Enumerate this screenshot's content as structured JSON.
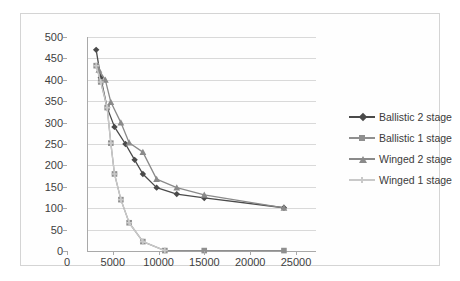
{
  "chart_data": {
    "type": "line",
    "title": "",
    "xlabel": "",
    "ylabel": "",
    "xlim": [
      0,
      25000
    ],
    "ylim": [
      0,
      500
    ],
    "xticks": [
      0,
      5000,
      10000,
      15000,
      20000,
      25000
    ],
    "yticks": [
      0,
      50,
      100,
      150,
      200,
      250,
      300,
      350,
      400,
      450,
      500
    ],
    "grid": "horizontal",
    "legend_position": "right",
    "colors": {
      "ballistic_2_stage": "#4a4a4a",
      "ballistic_1_stage": "#8f8f8f",
      "winged_2_stage": "#8a8a8a",
      "winged_1_stage": "#c9c9c9",
      "gridline": "#d9d9d9",
      "axis": "#a9a9a9",
      "border": "#d4d4d4",
      "text": "#3b3b3b"
    },
    "series": [
      {
        "name": "Ballistic 2 stage",
        "marker": "diamond",
        "color": "#4a4a4a",
        "points": [
          [
            1000,
            470
          ],
          [
            1500,
            405
          ],
          [
            2200,
            335
          ],
          [
            3000,
            290
          ],
          [
            4200,
            250
          ],
          [
            5200,
            213
          ],
          [
            6100,
            180
          ],
          [
            7600,
            148
          ],
          [
            9800,
            133
          ],
          [
            12800,
            124
          ],
          [
            21500,
            101
          ]
        ]
      },
      {
        "name": "Ballistic 1 stage",
        "marker": "square",
        "color": "#8f8f8f",
        "points": [
          [
            1000,
            433
          ],
          [
            1500,
            395
          ],
          [
            2200,
            335
          ],
          [
            2600,
            252
          ],
          [
            3000,
            180
          ],
          [
            3700,
            120
          ],
          [
            4600,
            66
          ],
          [
            6100,
            22
          ],
          [
            8500,
            1
          ],
          [
            12800,
            1
          ],
          [
            21500,
            1
          ]
        ]
      },
      {
        "name": "Winged 2 stage",
        "marker": "triangle",
        "color": "#8a8a8a",
        "points": [
          [
            1300,
            423
          ],
          [
            2000,
            400
          ],
          [
            2600,
            348
          ],
          [
            3700,
            300
          ],
          [
            4600,
            253
          ],
          [
            6100,
            231
          ],
          [
            7600,
            168
          ],
          [
            9800,
            148
          ],
          [
            12800,
            131
          ],
          [
            21500,
            101
          ]
        ]
      },
      {
        "name": "Winged 1 stage",
        "marker": "cross",
        "color": "#c9c9c9",
        "points": [
          [
            1000,
            433
          ],
          [
            1500,
            395
          ],
          [
            2200,
            335
          ],
          [
            2600,
            252
          ],
          [
            3000,
            180
          ],
          [
            3700,
            120
          ],
          [
            4600,
            66
          ],
          [
            6100,
            22
          ],
          [
            8500,
            1
          ]
        ]
      }
    ]
  },
  "legend": {
    "items": [
      {
        "label": "Ballistic 2 stage",
        "marker": "diamond",
        "color": "#4a4a4a"
      },
      {
        "label": "Ballistic 1 stage",
        "marker": "square",
        "color": "#8f8f8f"
      },
      {
        "label": "Winged 2 stage",
        "marker": "triangle",
        "color": "#8a8a8a"
      },
      {
        "label": "Winged 1 stage",
        "marker": "cross",
        "color": "#c9c9c9"
      }
    ]
  }
}
